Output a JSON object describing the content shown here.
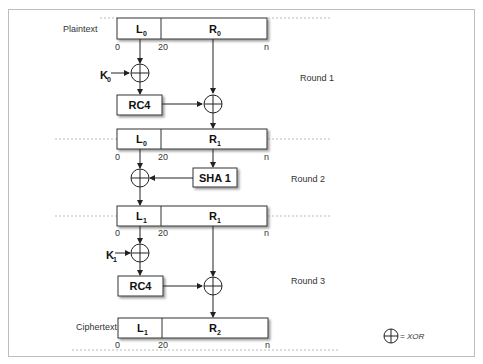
{
  "diagram": {
    "rows": [
      {
        "label": "Plaintext",
        "left": {
          "name": "L",
          "sub": "0"
        },
        "right": {
          "name": "R",
          "sub": "0"
        }
      },
      {
        "label": "",
        "left": {
          "name": "L",
          "sub": "0"
        },
        "right": {
          "name": "R",
          "sub": "1"
        }
      },
      {
        "label": "",
        "left": {
          "name": "L",
          "sub": "1"
        },
        "right": {
          "name": "R",
          "sub": "1"
        }
      },
      {
        "label": "Ciphertext",
        "left": {
          "name": "L",
          "sub": "1"
        },
        "right": {
          "name": "R",
          "sub": "2"
        }
      }
    ],
    "ticks": {
      "start": "0",
      "mid": "20",
      "end": "n"
    },
    "keys": [
      {
        "name": "K",
        "sub": "0"
      },
      {
        "name": "K",
        "sub": "1"
      }
    ],
    "functions": {
      "rc4": "RC4",
      "sha1": "SHA 1"
    },
    "rounds": [
      "Round 1",
      "Round 2",
      "Round 3"
    ],
    "legend": {
      "text": "= XOR"
    }
  }
}
